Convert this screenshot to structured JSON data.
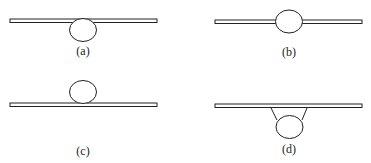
{
  "panels": [
    {
      "label": "(a)",
      "description": "bubble below bar, touching"
    },
    {
      "label": "(b)",
      "description": "bubble centered on bar"
    },
    {
      "label": "(c)",
      "description": "bubble above bar, touching"
    },
    {
      "label": "(d)",
      "description": "bubble hanging below bar via neck"
    }
  ],
  "colors": {
    "stroke": "#222222",
    "background": "#ffffff"
  }
}
